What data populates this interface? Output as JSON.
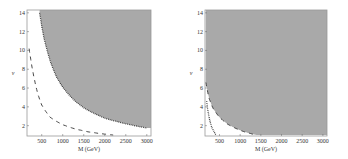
{
  "chart_data": [
    {
      "type": "line",
      "title": "",
      "xlabel": "M (GeV)",
      "ylabel": "ν",
      "xlim": [
        150,
        3100
      ],
      "ylim": [
        0.9,
        14.3
      ],
      "xticks": [
        500,
        1000,
        1500,
        2000,
        2500,
        3000
      ],
      "yticks": [
        2,
        4,
        6,
        8,
        10,
        12,
        14
      ],
      "grid": false,
      "shaded_region": "above dotted curve (excluded region)",
      "series": [
        {
          "name": "dotted boundary",
          "style": "dotted",
          "x": [
            450,
            550,
            700,
            850,
            1000,
            1250,
            1500,
            1750,
            2000,
            2500,
            3000
          ],
          "y": [
            14,
            11.4,
            8.9,
            7.2,
            6.1,
            4.8,
            3.9,
            3.3,
            2.8,
            2.2,
            1.75
          ]
        },
        {
          "name": "dashed curve",
          "style": "dashed",
          "x": [
            200,
            300,
            400,
            500,
            700,
            1000,
            1300,
            1600,
            1900,
            2200
          ],
          "y": [
            10.2,
            7.5,
            5.5,
            4.2,
            2.9,
            2.1,
            1.65,
            1.35,
            1.15,
            1.0
          ]
        }
      ]
    },
    {
      "type": "line",
      "title": "",
      "xlabel": "M (GeV)",
      "ylabel": "ν",
      "xlim": [
        150,
        3100
      ],
      "ylim": [
        0.9,
        14.3
      ],
      "xticks": [
        500,
        1000,
        1500,
        2000,
        2500,
        3000
      ],
      "yticks": [
        2,
        4,
        6,
        8,
        10,
        12,
        14
      ],
      "grid": false,
      "shaded_region": "above dashed curve (excluded region)",
      "series": [
        {
          "name": "dashed boundary",
          "style": "dashed",
          "x": [
            170,
            250,
            350,
            500,
            700,
            900,
            1100,
            1400
          ],
          "y": [
            6.6,
            4.9,
            3.8,
            2.9,
            2.15,
            1.7,
            1.35,
            1.0
          ]
        },
        {
          "name": "dotted curve",
          "style": "dotted",
          "x": [
            190,
            220,
            260,
            300,
            350,
            420
          ],
          "y": [
            4.6,
            3.6,
            2.7,
            2.0,
            1.5,
            1.0
          ]
        }
      ]
    }
  ],
  "plots": [
    {
      "xlabel": "M (GeV)",
      "ylabel": "ν",
      "xtick_labels": [
        "500",
        "1000",
        "1500",
        "2000",
        "2500",
        "3000"
      ],
      "ytick_labels": [
        "2",
        "4",
        "6",
        "8",
        "10",
        "12",
        "14"
      ]
    },
    {
      "xlabel": "M (GeV)",
      "ylabel": "ν",
      "xtick_labels": [
        "500",
        "1000",
        "1500",
        "2000",
        "2500",
        "3000"
      ],
      "ytick_labels": [
        "2",
        "4",
        "6",
        "8",
        "10",
        "12",
        "14"
      ]
    }
  ],
  "colors": {
    "shade": "#a9a9a9",
    "frame": "#9a9a9a",
    "curve": "#333333"
  }
}
